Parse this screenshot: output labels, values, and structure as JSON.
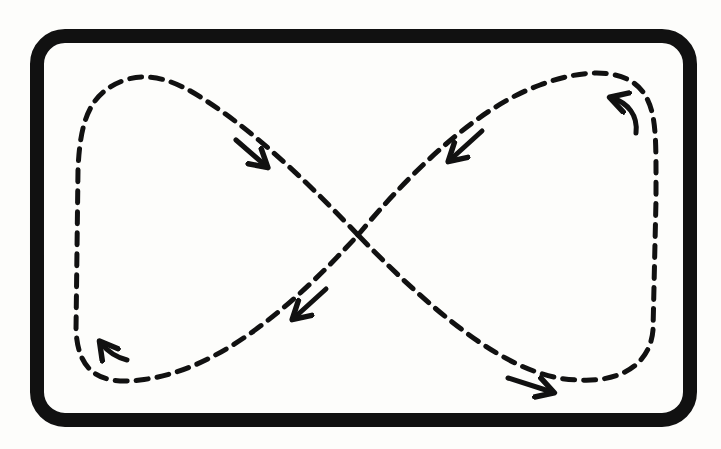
{
  "diagram": {
    "type": "figure-eight flow loop",
    "colors": {
      "background": "#fdfdfb",
      "ink": "#111111"
    },
    "frame": {
      "shape": "rounded-rectangle",
      "stroke": "thick solid"
    },
    "path": {
      "shape": "figure-eight",
      "stroke": "dashed",
      "crossing": "center"
    },
    "arrows": [
      {
        "id": "upper-left-arrow",
        "direction": "down-right"
      },
      {
        "id": "upper-right-arrow",
        "direction": "down-left"
      },
      {
        "id": "right-curved-arrow",
        "direction": "up-left (curved)"
      },
      {
        "id": "center-lower-arrow",
        "direction": "down-left"
      },
      {
        "id": "lower-left-curved-arrow",
        "direction": "up-left (curved)"
      },
      {
        "id": "lower-right-arrow",
        "direction": "right"
      }
    ]
  }
}
